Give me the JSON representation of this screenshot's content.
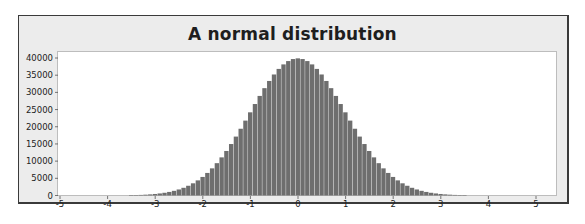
{
  "chart_data": {
    "type": "bar",
    "title": "A normal distribution",
    "xlabel": "",
    "ylabel": "",
    "xlim": [
      -5,
      5.4
    ],
    "ylim": [
      0,
      41500
    ],
    "x_ticks": [
      -5,
      -4,
      -3,
      -2,
      -1,
      0,
      1,
      2,
      3,
      4,
      5
    ],
    "y_ticks": [
      0,
      5000,
      10000,
      15000,
      20000,
      25000,
      30000,
      35000,
      40000
    ],
    "grid": false,
    "legend": null,
    "bin_width": 0.1,
    "bar_color": "#6e6e6e",
    "series": [
      {
        "name": "counts",
        "x": [
          -3.5,
          -3.4,
          -3.3,
          -3.2,
          -3.1,
          -3.0,
          -2.9,
          -2.8,
          -2.7,
          -2.6,
          -2.5,
          -2.4,
          -2.3,
          -2.2,
          -2.1,
          -2.0,
          -1.9,
          -1.8,
          -1.7,
          -1.6,
          -1.5,
          -1.4,
          -1.3,
          -1.2,
          -1.1,
          -1.0,
          -0.9,
          -0.8,
          -0.7,
          -0.6,
          -0.5,
          -0.4,
          -0.3,
          -0.2,
          -0.1,
          0.0,
          0.1,
          0.2,
          0.3,
          0.4,
          0.5,
          0.6,
          0.7,
          0.8,
          0.9,
          1.0,
          1.1,
          1.2,
          1.3,
          1.4,
          1.5,
          1.6,
          1.7,
          1.8,
          1.9,
          2.0,
          2.1,
          2.2,
          2.3,
          2.4,
          2.5,
          2.6,
          2.7,
          2.8,
          2.9,
          3.0,
          3.1,
          3.2,
          3.3,
          3.4,
          3.5
        ],
        "values": [
          87,
          119,
          172,
          238,
          327,
          443,
          596,
          792,
          1042,
          1358,
          1753,
          2239,
          2833,
          3547,
          4398,
          5399,
          6562,
          7895,
          9405,
          11092,
          12952,
          14973,
          17136,
          19419,
          21785,
          24197,
          26609,
          28969,
          31225,
          33322,
          35207,
          36827,
          38139,
          39104,
          39695,
          39894,
          39695,
          39104,
          38139,
          36827,
          35207,
          33322,
          31225,
          28969,
          26609,
          24197,
          21785,
          19419,
          17136,
          14973,
          12952,
          11092,
          9405,
          7895,
          6562,
          5399,
          4398,
          3547,
          2833,
          2239,
          1753,
          1358,
          1042,
          792,
          596,
          443,
          327,
          238,
          172,
          119,
          87
        ]
      }
    ]
  }
}
